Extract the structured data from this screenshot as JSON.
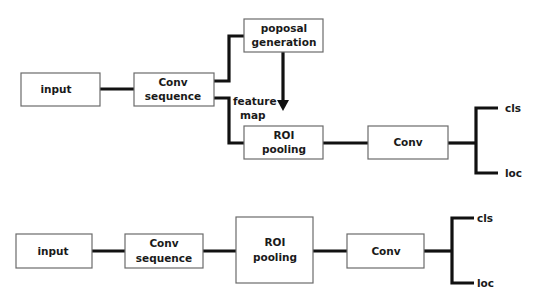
{
  "diagram": {
    "top_pipeline": {
      "input": "input",
      "conv_sequence": [
        "Conv",
        "sequence"
      ],
      "proposal_generation": [
        "poposal",
        "generation"
      ],
      "feature_map_label": [
        "feature",
        "map"
      ],
      "roi_pooling": [
        "ROI",
        "pooling"
      ],
      "conv": "Conv",
      "outputs": {
        "cls": "cls",
        "loc": "loc"
      }
    },
    "bottom_pipeline": {
      "input": "input",
      "conv_sequence": [
        "Conv",
        "sequence"
      ],
      "roi_pooling": [
        "ROI",
        "pooling"
      ],
      "conv": "Conv",
      "outputs": {
        "cls": "cls",
        "loc": "loc"
      }
    },
    "colors": {
      "line": "#111111",
      "box_border": "#6b6b6b",
      "background": "#ffffff"
    }
  }
}
